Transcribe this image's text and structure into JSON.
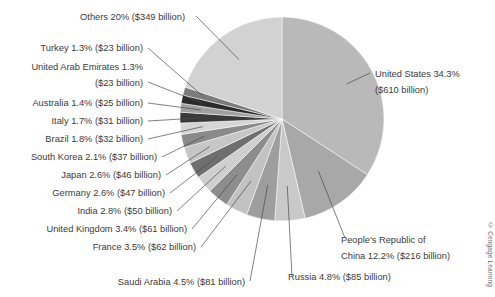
{
  "figure": {
    "title_partial": "",
    "credit": "© Cengage Learning"
  },
  "chart_data": {
    "type": "pie",
    "title": "",
    "xlabel": "",
    "ylabel": "",
    "units": "billion US dollars",
    "start_angle_deg": 0,
    "direction": "clockwise",
    "legend": "none (direct labels with leader lines)",
    "categories": [
      "United States",
      "People's Republic of China",
      "Russia",
      "Saudi Arabia",
      "France",
      "United Kingdom",
      "India",
      "Germany",
      "Japan",
      "South Korea",
      "Brazil",
      "Italy",
      "Australia",
      "United Arab Emirates",
      "Turkey",
      "Others"
    ],
    "values": [
      34.3,
      12.2,
      4.8,
      4.5,
      3.5,
      3.4,
      2.8,
      2.6,
      2.6,
      2.1,
      1.8,
      1.7,
      1.4,
      1.3,
      1.3,
      20.0
    ],
    "amounts": [
      610,
      216,
      85,
      81,
      62,
      61,
      50,
      47,
      46,
      37,
      32,
      31,
      25,
      23,
      23,
      349
    ],
    "colors": [
      "#b9b9b9",
      "#a8a8a8",
      "#c9c9c9",
      "#9e9e9e",
      "#c2c2c2",
      "#8d8d8d",
      "#cfcfcf",
      "#6f6f6f",
      "#c6c6c6",
      "#8a8a8a",
      "#d6d6d6",
      "#3a3a3a",
      "#a0a0a0",
      "#2b2b2b",
      "#7b7b7b",
      "#d2d2d2"
    ],
    "slices": [
      {
        "label": "United States 34.3%",
        "label2": "($610 billion)",
        "percent": 34.3,
        "amount": 610
      },
      {
        "label": "People's Republic of",
        "label2": "China 12.2% ($216 billion)",
        "percent": 12.2,
        "amount": 216
      },
      {
        "label": "Russia 4.8% ($85 billion)",
        "label2": "",
        "percent": 4.8,
        "amount": 85
      },
      {
        "label": "Saudi Arabia 4.5% ($81 billion)",
        "label2": "",
        "percent": 4.5,
        "amount": 81
      },
      {
        "label": "France 3.5% ($62 billion)",
        "label2": "",
        "percent": 3.5,
        "amount": 62
      },
      {
        "label": "United Kingdom 3.4% ($61 billion)",
        "label2": "",
        "percent": 3.4,
        "amount": 61
      },
      {
        "label": "India 2.8% ($50 billion)",
        "label2": "",
        "percent": 2.8,
        "amount": 50
      },
      {
        "label": "Germany 2.6% ($47 billion)",
        "label2": "",
        "percent": 2.6,
        "amount": 47
      },
      {
        "label": "Japan 2.6% ($46 billion)",
        "label2": "",
        "percent": 2.6,
        "amount": 46
      },
      {
        "label": "South Korea 2.1% ($37 billion)",
        "label2": "",
        "percent": 2.1,
        "amount": 37
      },
      {
        "label": "Brazil 1.8% ($32 billion)",
        "label2": "",
        "percent": 1.8,
        "amount": 32
      },
      {
        "label": "Italy 1.7% ($31 billion)",
        "label2": "",
        "percent": 1.7,
        "amount": 31
      },
      {
        "label": "Australia 1.4% ($25 billion)",
        "label2": "",
        "percent": 1.4,
        "amount": 25
      },
      {
        "label": "United Arab Emirates 1.3%",
        "label2": "($23 billion)",
        "percent": 1.3,
        "amount": 23
      },
      {
        "label": "Turkey 1.3% ($23 billion)",
        "label2": "",
        "percent": 1.3,
        "amount": 23
      },
      {
        "label": "Others 20% ($349 billion)",
        "label2": "",
        "percent": 20.0,
        "amount": 349
      }
    ]
  },
  "labels": {
    "others": "Others 20% ($349 billion)",
    "turkey": "Turkey 1.3% ($23 billion)",
    "uae_line1": "United Arab Emirates 1.3%",
    "uae_line2": "($23 billion)",
    "australia": "Australia 1.4% ($25 billion)",
    "italy": "Italy 1.7% ($31 billion)",
    "brazil": "Brazil 1.8% ($32 billion)",
    "south_korea": "South Korea 2.1% ($37 billion)",
    "japan": "Japan 2.6% ($46 billion)",
    "germany": "Germany 2.6% ($47 billion)",
    "india": "India 2.8% ($50 billion)",
    "united_kingdom": "United Kingdom 3.4% ($61 billion)",
    "france": "France 3.5% ($62 billion)",
    "saudi_arabia": "Saudi Arabia 4.5% ($81 billion)",
    "united_states_line1": "United States 34.3%",
    "united_states_line2": "($610 billion)",
    "china_line1": "People's Republic of",
    "china_line2": "China 12.2% ($216 billion)",
    "russia": "Russia 4.8% ($85 billion)"
  }
}
